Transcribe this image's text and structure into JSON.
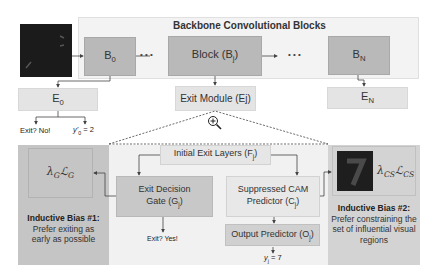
{
  "backbone": {
    "title": "Backbone Convolutional Blocks",
    "blocks": [
      {
        "label": "B",
        "sub": "0"
      },
      {
        "label": "Block (B",
        "sub": "j",
        "suffix": ")"
      },
      {
        "label": "B",
        "sub": "N"
      }
    ],
    "ellipsis_1": "• • •",
    "ellipsis_2": "• • •"
  },
  "exits": {
    "e0": {
      "label": "E",
      "sub": "0"
    },
    "ej": {
      "label": "Exit Module (Ej)"
    },
    "en": {
      "label": "E",
      "sub": "N"
    },
    "e0_outputs": {
      "exit_text": "Exit? No!",
      "pred_text_pre": "y'",
      "pred_sub": "0",
      "pred_value": " = 2"
    }
  },
  "zoom_icon": "magnifier-plus-icon",
  "module": {
    "initial_layers": {
      "label": "Initial Exit Layers (F",
      "sub": "j",
      "suffix": ")"
    },
    "gate": {
      "line1": "Exit Decision",
      "line2": "Gate (G",
      "sub": "j",
      "suffix": ")"
    },
    "gate_output": "Exit? Yes!",
    "cam": {
      "line1": "Suppressed CAM",
      "line2": "Predictor (C",
      "sub": "j",
      "suffix": ")"
    },
    "output_predictor": {
      "label": "Output Predictor (O",
      "sub": "j",
      "suffix": ")"
    },
    "final_pred": {
      "pre": "y",
      "sub": "j",
      "value": " = 7"
    }
  },
  "bias1": {
    "loss": "λGℒG",
    "loss_lambda": "λ",
    "loss_lambda_sub": "G",
    "loss_L": "ℒ",
    "loss_L_sub": "G",
    "title": "Inductive Bias #1:",
    "text": "Prefer exiting as early as possible"
  },
  "bias2": {
    "loss_lambda": "λ",
    "loss_lambda_sub": "CS",
    "loss_L": "ℒ",
    "loss_L_sub": "CS",
    "title": "Inductive Bias #2:",
    "text": "Prefer constraining the set of influential visual regions"
  },
  "colors": {
    "panel_left": "#c5c5c5",
    "panel_mid": "#f1f1f1",
    "panel_right": "#d3d3d3",
    "block_dark": "#b9b9b9",
    "exit_box": "#e4e4e4",
    "input_image": "#1b1b1b"
  }
}
